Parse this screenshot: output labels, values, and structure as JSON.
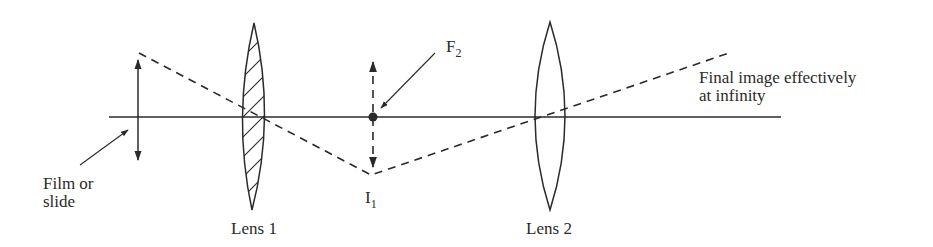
{
  "figure": {
    "type": "optical ray diagram (two-lens projector/viewer)",
    "colors": {
      "ink": "#2a2a2a",
      "background": "#ffffff"
    },
    "labels": {
      "film_line1": "Film or",
      "film_line2": "slide",
      "lens1": "Lens 1",
      "lens2": "Lens 2",
      "focal_point_main": "F",
      "focal_point_sub": "2",
      "image_main": "I",
      "image_sub": "1",
      "final_line1": "Final image effectively",
      "final_line2": "at infinity"
    },
    "elements": {
      "optical_axis": {
        "x1": 109,
        "x2": 781,
        "y": 117
      },
      "object_arrow": {
        "x": 138,
        "y_top": 55,
        "y_bottom": 165,
        "style": "solid double-headed"
      },
      "lens1": {
        "cx": 254,
        "top": 23,
        "bottom": 210,
        "half_width": 15,
        "hatched": true
      },
      "intermediate_image_arrow": {
        "x": 373,
        "y_top": 57,
        "y_bottom": 172,
        "style": "dashed double-headed"
      },
      "focal_point_F2": {
        "x": 373,
        "y": 117
      },
      "lens2": {
        "cx": 550,
        "top": 22,
        "bottom": 210,
        "half_width": 15,
        "hatched": false
      },
      "ray": {
        "points": [
          [
            139,
            53
          ],
          [
            371,
            175
          ],
          [
            732,
            52
          ]
        ],
        "style": "dashed"
      }
    }
  }
}
